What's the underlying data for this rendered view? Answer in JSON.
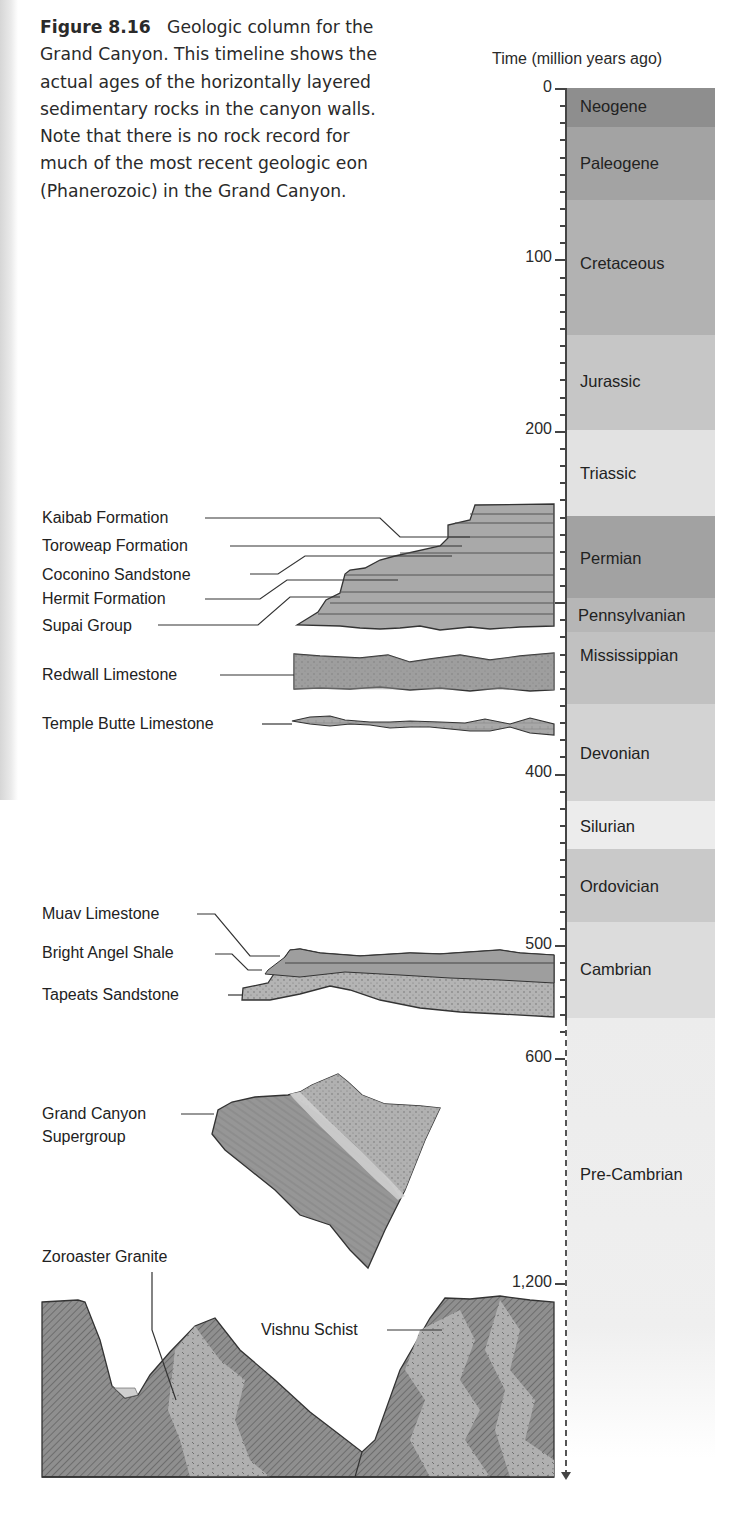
{
  "caption": {
    "figure_label": "Figure 8.16",
    "text": "Geologic column for the Grand Canyon. This timeline shows the actual ages of the horizontally layered sedimentary rocks in the canyon walls. Note that there is no rock record for much of the most recent geologic eon (Phanerozoic) in the Grand Canyon."
  },
  "axis": {
    "title": "Time (million years ago)",
    "tick_labels": [
      "0",
      "100",
      "200",
      "400",
      "500",
      "600",
      "1,200"
    ]
  },
  "periods": [
    {
      "name": "Neogene",
      "color": "#8e8e8e"
    },
    {
      "name": "Paleogene",
      "color": "#a3a3a3"
    },
    {
      "name": "Cretaceous",
      "color": "#b2b2b2"
    },
    {
      "name": "Jurassic",
      "color": "#c6c6c6"
    },
    {
      "name": "Triassic",
      "color": "#e2e2e2"
    },
    {
      "name": "Permian",
      "color": "#a2a2a2"
    },
    {
      "name": "Pennsylvanian",
      "color": "#b6b6b6"
    },
    {
      "name": "Mississippian",
      "color": "#c1c1c1"
    },
    {
      "name": "Devonian",
      "color": "#d3d3d3"
    },
    {
      "name": "Silurian",
      "color": "#ececec"
    },
    {
      "name": "Ordovician",
      "color": "#c9c9c9"
    },
    {
      "name": "Cambrian",
      "color": "#dcdcdc"
    },
    {
      "name": "Pre-Cambrian",
      "color": "#ededed"
    }
  ],
  "formations": {
    "kaibab": "Kaibab Formation",
    "toroweap": "Toroweap Formation",
    "coconino": "Coconino Sandstone",
    "hermit": "Hermit Formation",
    "supai": "Supai Group",
    "redwall": "Redwall Limestone",
    "temple_butte": "Temple Butte Limestone",
    "muav": "Muav Limestone",
    "bright_angel": "Bright Angel Shale",
    "tapeats": "Tapeats Sandstone",
    "supergroup_1": "Grand Canyon",
    "supergroup_2": "Supergroup",
    "zoroaster": "Zoroaster Granite",
    "vishnu": "Vishnu Schist"
  },
  "chart_data": {
    "type": "table",
    "title": "Geologic column for the Grand Canyon",
    "ylabel": "Time (million years ago)",
    "yticks": [
      0,
      100,
      200,
      400,
      500,
      600,
      1200
    ],
    "periods": [
      {
        "name": "Neogene",
        "start": 0,
        "end": 23
      },
      {
        "name": "Paleogene",
        "start": 23,
        "end": 66
      },
      {
        "name": "Cretaceous",
        "start": 66,
        "end": 145
      },
      {
        "name": "Jurassic",
        "start": 145,
        "end": 200
      },
      {
        "name": "Triassic",
        "start": 200,
        "end": 251
      },
      {
        "name": "Permian",
        "start": 251,
        "end": 299
      },
      {
        "name": "Pennsylvanian",
        "start": 299,
        "end": 318
      },
      {
        "name": "Mississippian",
        "start": 318,
        "end": 359
      },
      {
        "name": "Devonian",
        "start": 359,
        "end": 416
      },
      {
        "name": "Silurian",
        "start": 416,
        "end": 444
      },
      {
        "name": "Ordovician",
        "start": 444,
        "end": 488
      },
      {
        "name": "Cambrian",
        "start": 488,
        "end": 542
      },
      {
        "name": "Pre-Cambrian",
        "start": 542,
        "end": null
      }
    ],
    "rock_units": [
      {
        "name": "Kaibab Formation",
        "period": "Permian"
      },
      {
        "name": "Toroweap Formation",
        "period": "Permian"
      },
      {
        "name": "Coconino Sandstone",
        "period": "Permian"
      },
      {
        "name": "Hermit Formation",
        "period": "Permian"
      },
      {
        "name": "Supai Group",
        "period": "Permian-Pennsylvanian"
      },
      {
        "name": "Redwall Limestone",
        "period": "Mississippian"
      },
      {
        "name": "Temple Butte Limestone",
        "period": "Devonian"
      },
      {
        "name": "Muav Limestone",
        "period": "Cambrian"
      },
      {
        "name": "Bright Angel Shale",
        "period": "Cambrian"
      },
      {
        "name": "Tapeats Sandstone",
        "period": "Cambrian"
      },
      {
        "name": "Grand Canyon Supergroup",
        "period": "Pre-Cambrian"
      },
      {
        "name": "Zoroaster Granite",
        "period": "Pre-Cambrian"
      },
      {
        "name": "Vishnu Schist",
        "period": "Pre-Cambrian (~1,200+)"
      }
    ]
  }
}
